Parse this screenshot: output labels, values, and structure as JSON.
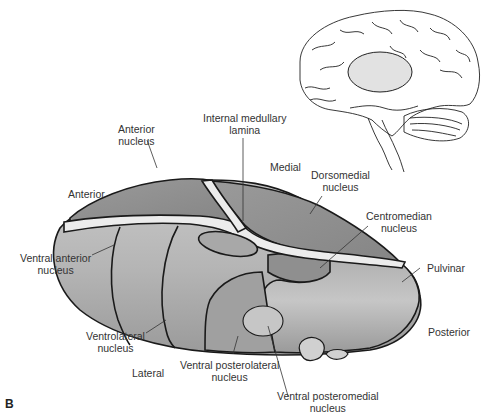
{
  "figure": {
    "panel_letter": "B",
    "inset": {
      "description": "Sagittal view of brain with thalamus highlighted"
    },
    "orientation": {
      "anterior": "Anterior",
      "posterior": "Posterior",
      "medial": "Medial",
      "lateral": "Lateral"
    },
    "labels": {
      "anterior_nucleus": [
        "Anterior",
        "nucleus"
      ],
      "internal_medullary_lamina": [
        "Internal medullary",
        "lamina"
      ],
      "dorsomedial_nucleus": [
        "Dorsomedial",
        "nucleus"
      ],
      "centromedian_nucleus": [
        "Centromedian",
        "nucleus"
      ],
      "pulvinar": "Pulvinar",
      "ventral_anterior_nucleus": [
        "Ventral anterior",
        "nucleus"
      ],
      "ventrolateral_nucleus": [
        "Ventrolateral",
        "nucleus"
      ],
      "ventral_posterolateral_nucleus": [
        "Ventral posterolateral",
        "nucleus"
      ],
      "ventral_posteromedial_nucleus": [
        "Ventral posteromedial",
        "nucleus"
      ]
    },
    "colors": {
      "dark_region": "#8e8e8e",
      "mid_region": "#a8a8a8",
      "light_region": "#c4c4c4",
      "lamina": "#ececec",
      "outline": "#1a1a1a"
    }
  }
}
